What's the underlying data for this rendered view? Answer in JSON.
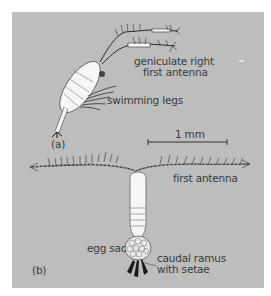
{
  "figure": {
    "panel_color": "#bdbdbd",
    "panels": [
      {
        "id": "a",
        "tag": "(a)",
        "labels": {
          "antenna_line1": "geniculate right",
          "antenna_line2": "first antenna",
          "legs": "swimming legs"
        }
      },
      {
        "id": "b",
        "tag": "(b)",
        "labels": {
          "antenna": "first antenna",
          "egg_sac": "egg sac",
          "caudal_line1": "caudal ramus",
          "caudal_line2": "with setae"
        }
      }
    ],
    "scale_bar": {
      "label": "1 mm"
    }
  }
}
